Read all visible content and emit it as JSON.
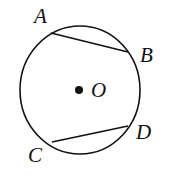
{
  "diagram": {
    "circle": {
      "cx": 80,
      "cy": 90,
      "rx": 60,
      "ry": 64,
      "stroke": "#111111"
    },
    "center": {
      "label": "O",
      "x": 80,
      "y": 90
    },
    "points": [
      {
        "label": "A",
        "x": 51,
        "y": 33
      },
      {
        "label": "B",
        "x": 128,
        "y": 52
      },
      {
        "label": "C",
        "x": 52,
        "y": 142
      },
      {
        "label": "D",
        "x": 128,
        "y": 126
      }
    ],
    "chords": [
      [
        "A",
        "B"
      ],
      [
        "C",
        "D"
      ]
    ]
  }
}
